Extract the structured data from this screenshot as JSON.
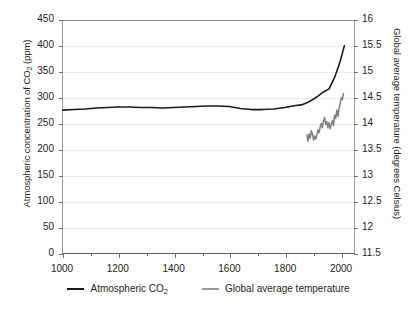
{
  "chart_data": {
    "type": "line",
    "title": "",
    "xlabel": "",
    "ylabel": "Atmospheric concentration of CO2 (ppm)",
    "y2label": "Global average temperature (degrees Celsius)",
    "xlim": [
      1000,
      2050
    ],
    "ylim": [
      0,
      450
    ],
    "y2lim": [
      11.5,
      16
    ],
    "grid": true,
    "legend_position": "bottom",
    "xticks": [
      1000,
      1200,
      1400,
      1600,
      1800,
      2000
    ],
    "xticks_minor": [
      1100,
      1300,
      1500,
      1700,
      1900
    ],
    "yticks": [
      0,
      50,
      100,
      150,
      200,
      250,
      300,
      350,
      400,
      450
    ],
    "y2ticks": [
      11.5,
      12,
      12.5,
      13,
      13.5,
      14,
      14.5,
      15,
      15.5,
      16
    ],
    "series": [
      {
        "name": "Atmospheric CO2",
        "axis": "left",
        "color": "#1a1a1a",
        "units": "ppm",
        "x": [
          1000,
          1040,
          1080,
          1120,
          1160,
          1200,
          1240,
          1280,
          1320,
          1360,
          1400,
          1440,
          1480,
          1520,
          1560,
          1600,
          1640,
          1680,
          1720,
          1760,
          1800,
          1840,
          1860,
          1880,
          1900,
          1920,
          1940,
          1960,
          1980,
          2000,
          2015
        ],
        "values": [
          276,
          277,
          278,
          280,
          281,
          282,
          282,
          281,
          281,
          280,
          281,
          282,
          283,
          284,
          284,
          283,
          279,
          277,
          277,
          278,
          281,
          285,
          286,
          290,
          296,
          303,
          311,
          317,
          339,
          370,
          400
        ]
      },
      {
        "name": "Global average temperature",
        "axis": "right",
        "color": "#808080",
        "units": "degrees Celsius",
        "x": [
          1880,
          1884,
          1888,
          1892,
          1896,
          1900,
          1904,
          1908,
          1912,
          1916,
          1920,
          1924,
          1928,
          1932,
          1936,
          1940,
          1944,
          1948,
          1952,
          1956,
          1960,
          1964,
          1968,
          1972,
          1976,
          1980,
          1984,
          1988,
          1992,
          1996,
          2000,
          2004,
          2008,
          2012
        ],
        "values": [
          13.78,
          13.66,
          13.8,
          13.72,
          13.86,
          13.8,
          13.68,
          13.76,
          13.7,
          13.78,
          13.88,
          13.82,
          13.94,
          14.0,
          13.92,
          14.06,
          14.12,
          13.98,
          14.04,
          13.92,
          14.02,
          13.9,
          13.98,
          14.06,
          13.96,
          14.16,
          14.1,
          14.26,
          14.14,
          14.3,
          14.38,
          14.5,
          14.46,
          14.58
        ]
      }
    ]
  },
  "legend": {
    "items": [
      {
        "label_prefix": "Atmospheric CO",
        "label_sub": "2",
        "label_suffix": "",
        "color": "#1a1a1a"
      },
      {
        "label_prefix": "Global average temperature",
        "label_sub": "",
        "label_suffix": "",
        "color": "#9a9a9a"
      }
    ]
  },
  "axes": {
    "left_title_prefix": "Atmospheric concentration of CO",
    "left_title_sub": "2",
    "left_title_suffix": " (ppm)",
    "right_title": "Global average temperature (degrees Celsius)"
  }
}
